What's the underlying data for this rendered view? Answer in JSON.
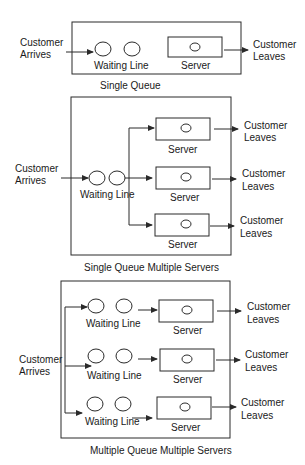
{
  "diagrams": [
    {
      "caption": "Single Queue",
      "arrive_label": [
        "Customer",
        "Arrives"
      ],
      "waiting_line_label": "Waiting Line",
      "server_labels": [
        "Server"
      ],
      "leave_labels": [
        [
          "Customer",
          "Leaves"
        ]
      ]
    },
    {
      "caption": "Single Queue Multiple Servers",
      "arrive_label": [
        "Customer",
        "Arrives"
      ],
      "waiting_line_label": "Waiting Line",
      "server_labels": [
        "Server",
        "Server",
        "Server"
      ],
      "leave_labels": [
        [
          "Customer",
          "Leaves"
        ],
        [
          "Customer",
          "Leaves"
        ],
        [
          "Customer",
          "Leaves"
        ]
      ]
    },
    {
      "caption": "Multiple Queue Multiple Servers",
      "arrive_label": [
        "Customer",
        "Arrives"
      ],
      "waiting_line_labels": [
        "Waiting Line",
        "Waiting Line",
        "Waiting Line"
      ],
      "server_labels": [
        "Server",
        "Server",
        "Server"
      ],
      "leave_labels": [
        [
          "Customer",
          "Leaves"
        ],
        [
          "Customer",
          "Leaves"
        ],
        [
          "Customer",
          "Leaves"
        ]
      ]
    }
  ],
  "colors": {
    "stroke": "#2a2a2a",
    "text": "#1a1a1a",
    "background": "#ffffff"
  }
}
